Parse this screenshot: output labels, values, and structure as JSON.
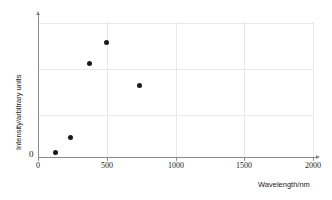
{
  "chart_data": {
    "type": "scatter",
    "title": "",
    "xlabel": "Wavelength/nm",
    "ylabel": "Intensity/arbitrary units",
    "xlim": [
      0,
      2000
    ],
    "ylim": [
      0,
      3.4
    ],
    "xticks": [
      0,
      500,
      1000,
      1500,
      2000
    ],
    "xtick_labels": [
      "0",
      "500",
      "1000",
      "1500",
      "2000"
    ],
    "yticks": [
      0
    ],
    "ytick_labels": [
      "0"
    ],
    "grid": true,
    "grid_horizontal_values": [
      1,
      2,
      3
    ],
    "grid_vertical_values": [
      500,
      1000,
      1500,
      2000
    ],
    "legend": null,
    "series": [
      {
        "name": "Intensity vs wavelength",
        "marker": "filled-circle",
        "color": "#1a1a1a",
        "points": [
          {
            "x": 124,
            "y": 0.11
          },
          {
            "x": 233,
            "y": 0.43
          },
          {
            "x": 371,
            "y": 2.09
          },
          {
            "x": 500,
            "y": 2.57
          },
          {
            "x": 735,
            "y": 1.59
          }
        ]
      }
    ]
  },
  "colors": {
    "axis": "#8a8a8a",
    "grid": "#e8e8e8",
    "marker": "#1a1a1a",
    "text": "#1a1a1a",
    "background": "#ffffff"
  }
}
